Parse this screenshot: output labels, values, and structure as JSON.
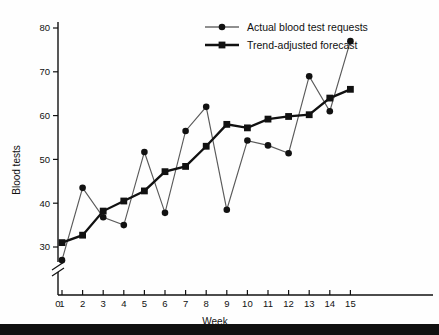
{
  "chart_data": {
    "type": "line",
    "title": "",
    "xlabel": "Week",
    "ylabel": "Blood tests",
    "x": [
      1,
      2,
      3,
      4,
      5,
      6,
      7,
      8,
      9,
      10,
      11,
      12,
      13,
      14,
      15
    ],
    "xticks": [
      "0",
      "1",
      "2",
      "3",
      "4",
      "5",
      "6",
      "7",
      "8",
      "9",
      "10",
      "11",
      "12",
      "13",
      "14",
      "15"
    ],
    "yticks": [
      "30",
      "40",
      "50",
      "60",
      "70",
      "80"
    ],
    "xlim": [
      0,
      16
    ],
    "ylim": [
      26,
      82
    ],
    "grid": false,
    "axis_break": true,
    "legend_position": "top-center",
    "series": [
      {
        "name": "Actual blood test requests",
        "marker": "circle",
        "color": "#5a5a5a",
        "values": [
          27,
          43.5,
          36.8,
          35,
          51.7,
          37.8,
          56.5,
          62,
          38.5,
          54.3,
          53.2,
          51.4,
          69,
          61,
          77
        ]
      },
      {
        "name": "Trend-adjusted forecast",
        "marker": "square",
        "color": "#111111",
        "values": [
          31,
          32.7,
          38.2,
          40.5,
          42.8,
          47.2,
          48.4,
          53,
          58,
          57.2,
          59.2,
          59.8,
          60.2,
          64,
          66
        ]
      }
    ]
  },
  "legend": {
    "items": [
      {
        "label": "Actual blood test requests",
        "marker": "circle"
      },
      {
        "label": "Trend-adjusted forecast",
        "marker": "square"
      }
    ]
  },
  "axes": {
    "y_title": "Blood tests",
    "x_title": "Week"
  }
}
